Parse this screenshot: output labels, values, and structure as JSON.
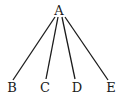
{
  "diagram": {
    "type": "tree",
    "root": {
      "id": "A",
      "label": "A"
    },
    "children": [
      {
        "id": "B",
        "label": "B"
      },
      {
        "id": "C",
        "label": "C"
      },
      {
        "id": "D",
        "label": "D"
      },
      {
        "id": "E",
        "label": "E"
      }
    ],
    "edges": [
      {
        "from": "A",
        "to": "B"
      },
      {
        "from": "A",
        "to": "C"
      },
      {
        "from": "A",
        "to": "D"
      },
      {
        "from": "A",
        "to": "E"
      }
    ]
  }
}
